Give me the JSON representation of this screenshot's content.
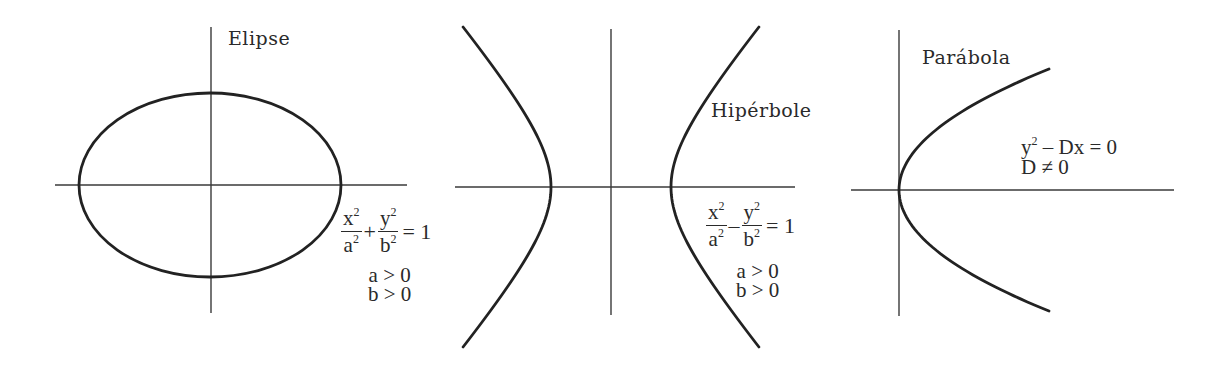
{
  "figure": {
    "width": 1225,
    "height": 372,
    "colors": {
      "background": "#ffffff",
      "curve": "#222222",
      "axis": "#3a3a3a",
      "text": "#2a2a2a"
    }
  },
  "panels": {
    "ellipse": {
      "label": "Elipse",
      "equation": {
        "term1_num": "x",
        "term1_den": "a",
        "operator": "+",
        "term2_num": "y",
        "term2_den": "b",
        "exponent": "2",
        "rhs": "= 1"
      },
      "conditions": [
        "a > 0",
        "b > 0"
      ],
      "geometry": {
        "center": [
          210,
          185
        ],
        "rx": 131,
        "ry": 92,
        "x_axis": [
          55,
          407
        ],
        "y_axis": [
          27,
          313
        ]
      }
    },
    "hyperbola": {
      "label": "Hipérbole",
      "equation": {
        "term1_num": "x",
        "term1_den": "a",
        "operator": "–",
        "term2_num": "y",
        "term2_den": "b",
        "exponent": "2",
        "rhs": "= 1"
      },
      "conditions": [
        "a > 0",
        "b > 0"
      ],
      "geometry": {
        "center": [
          611,
          187
        ],
        "a": 60,
        "b": 71,
        "y_extent": 160,
        "x_axis": [
          455,
          795
        ],
        "y_axis": [
          29,
          315
        ]
      }
    },
    "parabola": {
      "label": "Parábola",
      "equation": {
        "lhs": "y",
        "exponent": "2",
        "rest": "– Dx = 0"
      },
      "conditions": [
        "D ≠ 0"
      ],
      "geometry": {
        "vertex": [
          899,
          190
        ],
        "end_dx": 150,
        "end_dy": 121,
        "x_axis": [
          851,
          1174
        ],
        "y_axis": [
          30,
          316
        ]
      }
    }
  }
}
